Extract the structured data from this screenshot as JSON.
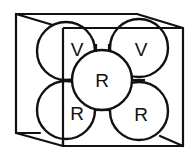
{
  "diagram": {
    "title": "",
    "stroke_color": "#111111",
    "background": "#ffffff",
    "spheres": [
      {
        "id": "top-left",
        "label": "V",
        "cx": 66,
        "cy": 51,
        "r": 29,
        "lx": 77,
        "ly": 49
      },
      {
        "id": "top-right",
        "label": "V",
        "cx": 139,
        "cy": 48,
        "r": 29,
        "lx": 141,
        "ly": 49
      },
      {
        "id": "center",
        "label": "R",
        "cx": 102,
        "cy": 80,
        "r": 30,
        "lx": 102,
        "ly": 80
      },
      {
        "id": "bottom-left",
        "label": "R",
        "cx": 66,
        "cy": 110,
        "r": 29,
        "lx": 77,
        "ly": 113
      },
      {
        "id": "bottom-right",
        "label": "R",
        "cx": 139,
        "cy": 111,
        "r": 29,
        "lx": 141,
        "ly": 114
      }
    ]
  }
}
